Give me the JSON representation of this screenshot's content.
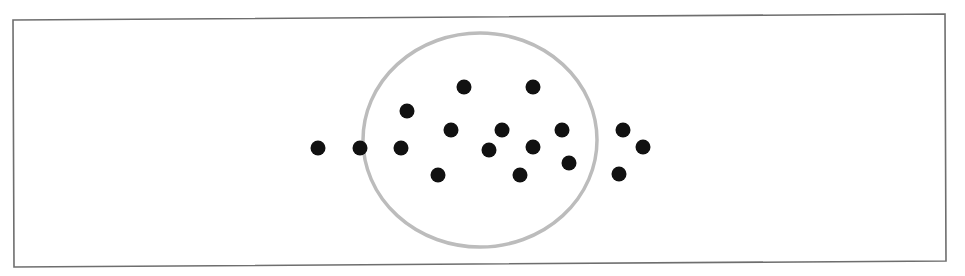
{
  "diagram": {
    "frame": {
      "points": [
        [
          13,
          20
        ],
        [
          945,
          14
        ],
        [
          946,
          261
        ],
        [
          14,
          267
        ]
      ],
      "stroke": "#6e6e6e",
      "stroke_width": 1.6
    },
    "boundary": {
      "cx": 480,
      "cy": 140,
      "rx": 117,
      "ry": 107,
      "stroke": "#bcbcbc",
      "stroke_width": 3.5
    },
    "dot_style": {
      "r": 7.5,
      "fill": "#111111"
    },
    "dots": [
      {
        "x": 318,
        "y": 148,
        "region": "outside"
      },
      {
        "x": 360,
        "y": 148,
        "region": "on-boundary"
      },
      {
        "x": 401,
        "y": 148,
        "region": "inside"
      },
      {
        "x": 407,
        "y": 111,
        "region": "inside"
      },
      {
        "x": 464,
        "y": 87,
        "region": "inside"
      },
      {
        "x": 533,
        "y": 87,
        "region": "inside"
      },
      {
        "x": 451,
        "y": 130,
        "region": "inside"
      },
      {
        "x": 502,
        "y": 130,
        "region": "inside"
      },
      {
        "x": 562,
        "y": 130,
        "region": "inside"
      },
      {
        "x": 489,
        "y": 150,
        "region": "inside"
      },
      {
        "x": 533,
        "y": 147,
        "region": "inside"
      },
      {
        "x": 569,
        "y": 163,
        "region": "inside"
      },
      {
        "x": 438,
        "y": 175,
        "region": "inside"
      },
      {
        "x": 520,
        "y": 175,
        "region": "inside"
      },
      {
        "x": 623,
        "y": 130,
        "region": "outside"
      },
      {
        "x": 643,
        "y": 147,
        "region": "outside"
      },
      {
        "x": 619,
        "y": 174,
        "region": "outside"
      }
    ]
  }
}
